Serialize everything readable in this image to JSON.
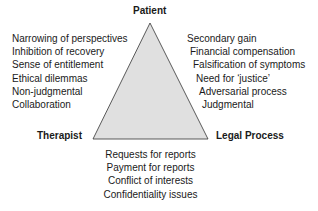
{
  "diagram": {
    "triangle": {
      "fill": "#e0e0e0",
      "stroke": "#333333"
    },
    "vertices": {
      "top": "Patient",
      "bottom_left": "Therapist",
      "bottom_right": "Legal Process"
    },
    "left_list": [
      "Narrowing of perspectives",
      "Inhibition of recovery",
      "Sense of entitlement",
      "Ethical dilemmas",
      "Non-judgmental",
      "Collaboration"
    ],
    "right_list": [
      "Secondary gain",
      "Financial compensation",
      "Falsification of symptoms",
      "Need for ‘justice’",
      "Adversarial process",
      "Judgmental"
    ],
    "bottom_list": [
      "Requests for reports",
      "Payment for reports",
      "Conflict of interests",
      "Confidentiality issues"
    ]
  }
}
